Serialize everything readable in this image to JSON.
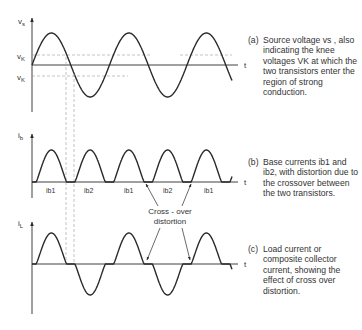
{
  "panels": {
    "a": {
      "ylabel": "v",
      "ylabel_sub": "s",
      "tlabel": "t",
      "knee_upper": "v",
      "knee_upper_sub": "K",
      "knee_lower": "v",
      "knee_lower_sub": "K",
      "caption_label": "(a)",
      "caption": "Source voltage vs , also indicating the knee voltages VK at which the two transistors enter the region of strong conduction."
    },
    "b": {
      "ylabel": "i",
      "ylabel_sub": "b",
      "tlabel": "t",
      "pulse_labels": [
        "ib1",
        "ib2",
        "ib1",
        "ib2",
        "ib1"
      ],
      "caption_label": "(b)",
      "caption": "Base currents ib1 and ib2, with distortion due to the crossover between the two transistors."
    },
    "c": {
      "ylabel": "i",
      "ylabel_sub": "L",
      "tlabel": "t",
      "caption_label": "(c)",
      "caption": "Load current or composite collector current, showing the effect of cross over distortion."
    }
  },
  "annotation": {
    "line1": "Cross - over",
    "line2": "distortion"
  },
  "colors": {
    "ink": "#2a2a2a",
    "dashed": "#9a9a9a",
    "background": "#ffffff"
  }
}
